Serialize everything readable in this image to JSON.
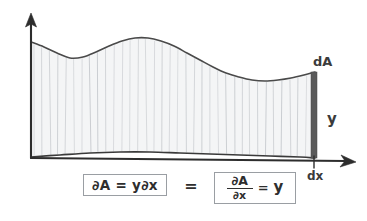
{
  "figure": {
    "background_color": "#ffffff",
    "ink_color": "#2d2d2d",
    "fill_color": "#f4f5f6",
    "hatch_color": "#b9bdc2",
    "strip_color": "#5a5a5a",
    "axes": {
      "y_axis_name": "vertical-axis-arrow",
      "x_axis_name": "horizontal-axis-arrow"
    },
    "labels": {
      "dA": "dA",
      "y": "y",
      "dx": "dx"
    },
    "formula": {
      "left_box": "∂A = y∂x",
      "equals": "=",
      "right_numerator": "∂A",
      "right_denominator": "∂x",
      "right_equals": "=",
      "right_value": "y"
    }
  },
  "chart_data": {
    "type": "area",
    "subtitle": "",
    "xlabel": "dx",
    "ylabel": "y",
    "grid": false,
    "legend": "none",
    "annotations": [
      {
        "text": "dA",
        "x": 320,
        "y": 62,
        "note": "label of the thin shaded strip at the right edge"
      },
      {
        "text": "y",
        "x": 330,
        "y": 120,
        "note": "height of the strip"
      },
      {
        "text": "dx",
        "x": 318,
        "y": 178,
        "note": "infinitesimal width along the x-axis"
      }
    ],
    "axis_pixel_ranges": {
      "x": [
        31,
        355
      ],
      "y": [
        15,
        158
      ]
    },
    "curve_top_points": [
      [
        31,
        42
      ],
      [
        44,
        47
      ],
      [
        57,
        53
      ],
      [
        70,
        58
      ],
      [
        83,
        57
      ],
      [
        96,
        52
      ],
      [
        109,
        46
      ],
      [
        122,
        41
      ],
      [
        135,
        38
      ],
      [
        148,
        38
      ],
      [
        161,
        41
      ],
      [
        174,
        46
      ],
      [
        187,
        53
      ],
      [
        200,
        60
      ],
      [
        213,
        67
      ],
      [
        226,
        73
      ],
      [
        239,
        77
      ],
      [
        252,
        80
      ],
      [
        265,
        81
      ],
      [
        278,
        80
      ],
      [
        291,
        78
      ],
      [
        304,
        75
      ],
      [
        315,
        72
      ]
    ],
    "curve_base_points": [
      [
        31,
        157
      ],
      [
        60,
        155
      ],
      [
        90,
        153
      ],
      [
        120,
        152
      ],
      [
        150,
        152
      ],
      [
        180,
        153
      ],
      [
        210,
        154
      ],
      [
        240,
        155
      ],
      [
        270,
        156
      ],
      [
        300,
        157
      ],
      [
        315,
        158
      ]
    ],
    "hatch_spacing_px": 8,
    "strip": {
      "x_left": 311,
      "x_right": 317,
      "y_top": 72,
      "y_bottom": 158
    }
  }
}
